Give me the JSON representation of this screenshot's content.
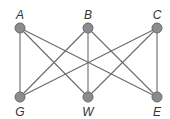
{
  "diagram": {
    "type": "graph",
    "colors": {
      "edge": "#6a6a6a",
      "node_fill": "#8c8c8c",
      "label": "#333333",
      "background": "#ffffff"
    },
    "nodes": [
      {
        "id": "A",
        "label": "A",
        "x": 20,
        "y": 28,
        "label_pos": "top"
      },
      {
        "id": "B",
        "label": "B",
        "x": 88,
        "y": 28,
        "label_pos": "top"
      },
      {
        "id": "C",
        "label": "C",
        "x": 157,
        "y": 28,
        "label_pos": "top"
      },
      {
        "id": "G",
        "label": "G",
        "x": 20,
        "y": 97,
        "label_pos": "bottom"
      },
      {
        "id": "W",
        "label": "W",
        "x": 88,
        "y": 97,
        "label_pos": "bottom"
      },
      {
        "id": "E",
        "label": "E",
        "x": 157,
        "y": 97,
        "label_pos": "bottom"
      }
    ],
    "edges": [
      [
        "A",
        "G"
      ],
      [
        "A",
        "W"
      ],
      [
        "A",
        "E"
      ],
      [
        "B",
        "G"
      ],
      [
        "B",
        "W"
      ],
      [
        "B",
        "E"
      ],
      [
        "C",
        "G"
      ],
      [
        "C",
        "W"
      ],
      [
        "C",
        "E"
      ]
    ]
  }
}
